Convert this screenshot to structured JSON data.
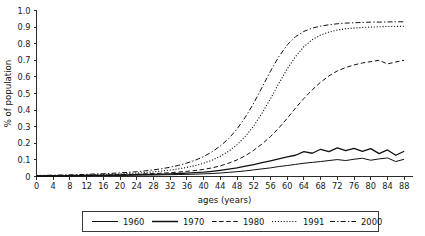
{
  "chart_data": {
    "type": "line",
    "title": "",
    "xlabel": "ages (years)",
    "ylabel": "% of population",
    "xlim": [
      0,
      90
    ],
    "ylim": [
      0,
      1.0
    ],
    "grid": false,
    "legend_position": "bottom",
    "x_ticks": [
      0,
      4,
      8,
      12,
      16,
      20,
      24,
      28,
      32,
      36,
      40,
      44,
      48,
      52,
      56,
      60,
      64,
      68,
      72,
      76,
      80,
      84,
      88
    ],
    "x_tick_labels": [
      "0",
      "4",
      "8",
      "12",
      "16",
      "20",
      "24",
      "28",
      "32",
      "36",
      "40",
      "44",
      "48",
      "52",
      "56",
      "60",
      "64",
      "68",
      "72",
      "76",
      "80",
      "84",
      "88"
    ],
    "y_ticks": [
      0,
      0.1,
      0.2,
      0.3,
      0.4,
      0.5,
      0.6,
      0.7,
      0.8,
      0.9,
      1.0
    ],
    "y_tick_labels": [
      "0",
      "0.1",
      "0.2",
      "0.3",
      "0.4",
      "0.5",
      "0.6",
      "0.7",
      "0.8",
      "0.9",
      "1.0"
    ],
    "x": [
      0,
      2,
      4,
      6,
      8,
      10,
      12,
      14,
      16,
      18,
      20,
      22,
      24,
      26,
      28,
      30,
      32,
      34,
      36,
      38,
      40,
      42,
      44,
      46,
      48,
      50,
      52,
      54,
      56,
      58,
      60,
      62,
      64,
      66,
      68,
      70,
      72,
      74,
      76,
      78,
      80,
      82,
      84,
      86,
      88
    ],
    "series": [
      {
        "name": "1960",
        "style": "solid",
        "values": [
          0.002,
          0.002,
          0.003,
          0.003,
          0.004,
          0.004,
          0.005,
          0.005,
          0.006,
          0.006,
          0.007,
          0.007,
          0.008,
          0.009,
          0.009,
          0.01,
          0.011,
          0.012,
          0.013,
          0.014,
          0.016,
          0.018,
          0.021,
          0.025,
          0.029,
          0.034,
          0.04,
          0.046,
          0.052,
          0.06,
          0.066,
          0.073,
          0.08,
          0.085,
          0.09,
          0.096,
          0.102,
          0.096,
          0.104,
          0.11,
          0.098,
          0.106,
          0.112,
          0.09,
          0.104
        ]
      },
      {
        "name": "1970",
        "style": "solid",
        "values": [
          0.003,
          0.003,
          0.004,
          0.004,
          0.005,
          0.005,
          0.006,
          0.007,
          0.007,
          0.008,
          0.009,
          0.01,
          0.011,
          0.012,
          0.013,
          0.014,
          0.016,
          0.018,
          0.02,
          0.023,
          0.026,
          0.031,
          0.037,
          0.044,
          0.052,
          0.062,
          0.072,
          0.083,
          0.094,
          0.106,
          0.118,
          0.128,
          0.15,
          0.14,
          0.164,
          0.15,
          0.172,
          0.156,
          0.17,
          0.152,
          0.168,
          0.138,
          0.16,
          0.128,
          0.152
        ]
      },
      {
        "name": "1980",
        "style": "dashed",
        "values": [
          0.004,
          0.004,
          0.005,
          0.005,
          0.006,
          0.006,
          0.007,
          0.008,
          0.009,
          0.01,
          0.011,
          0.012,
          0.014,
          0.016,
          0.018,
          0.02,
          0.023,
          0.027,
          0.031,
          0.036,
          0.043,
          0.052,
          0.064,
          0.08,
          0.1,
          0.125,
          0.158,
          0.196,
          0.24,
          0.292,
          0.35,
          0.412,
          0.47,
          0.522,
          0.568,
          0.606,
          0.636,
          0.656,
          0.672,
          0.684,
          0.692,
          0.7,
          0.678,
          0.69,
          0.7
        ]
      },
      {
        "name": "1991",
        "style": "dotted",
        "values": [
          0.005,
          0.006,
          0.006,
          0.007,
          0.008,
          0.009,
          0.01,
          0.011,
          0.013,
          0.014,
          0.016,
          0.018,
          0.021,
          0.024,
          0.028,
          0.033,
          0.039,
          0.046,
          0.055,
          0.066,
          0.08,
          0.098,
          0.122,
          0.152,
          0.192,
          0.242,
          0.305,
          0.382,
          0.468,
          0.56,
          0.648,
          0.722,
          0.782,
          0.824,
          0.852,
          0.87,
          0.882,
          0.89,
          0.894,
          0.898,
          0.9,
          0.902,
          0.904,
          0.904,
          0.905
        ]
      },
      {
        "name": "2000",
        "style": "dashdot",
        "values": [
          0.006,
          0.007,
          0.008,
          0.009,
          0.01,
          0.011,
          0.013,
          0.015,
          0.017,
          0.019,
          0.022,
          0.025,
          0.029,
          0.034,
          0.04,
          0.047,
          0.056,
          0.067,
          0.081,
          0.098,
          0.12,
          0.148,
          0.184,
          0.228,
          0.286,
          0.358,
          0.442,
          0.538,
          0.634,
          0.722,
          0.792,
          0.842,
          0.874,
          0.894,
          0.906,
          0.914,
          0.92,
          0.924,
          0.926,
          0.928,
          0.93,
          0.93,
          0.931,
          0.932,
          0.932
        ]
      }
    ],
    "legend": [
      {
        "label": "1960",
        "style": "solid"
      },
      {
        "label": "1970",
        "style": "solid"
      },
      {
        "label": "1980",
        "style": "dashed"
      },
      {
        "label": "1991",
        "style": "dotted"
      },
      {
        "label": "2000",
        "style": "dashdot"
      }
    ],
    "colors": {
      "line": "#111111",
      "axis": "#2b2b2b",
      "background": "#ffffff"
    }
  }
}
